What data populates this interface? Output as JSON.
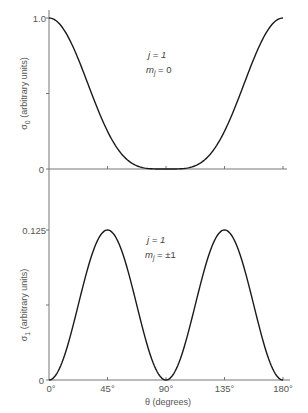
{
  "chart_data": [
    {
      "type": "line",
      "panel": "top",
      "ylabel": "σ0 (arbitrary units)",
      "ylabel_main": "σ",
      "ylabel_sub": "0",
      "ylabel_rest": " (arbitrary units)",
      "xlabel": "",
      "xlim": [
        0,
        180
      ],
      "ylim": [
        0,
        1.0
      ],
      "y_ticks": [
        0,
        0.5,
        1.0
      ],
      "y_tick_labels": [
        "0",
        "",
        "1.0"
      ],
      "x_ticks": [
        0,
        45,
        90,
        135,
        180
      ],
      "function": "cos^4(theta)",
      "annotation": {
        "line1": "j = 1",
        "line2_main": "m",
        "line2_sub": "j",
        "line2_rest": " = 0"
      },
      "series": [
        {
          "name": "j=1, mj=0",
          "x": [
            0,
            15,
            30,
            45,
            60,
            75,
            90,
            105,
            120,
            135,
            150,
            165,
            180
          ],
          "y": [
            1.0,
            0.871,
            0.5625,
            0.25,
            0.0625,
            0.0045,
            0.0,
            0.0045,
            0.0625,
            0.25,
            0.5625,
            0.871,
            1.0
          ]
        }
      ]
    },
    {
      "type": "line",
      "panel": "bottom",
      "ylabel": "σ1 (arbitrary units)",
      "ylabel_main": "σ",
      "ylabel_sub": "1",
      "ylabel_rest": " (arbitrary units)",
      "xlabel": "θ (degrees)",
      "xlim": [
        0,
        180
      ],
      "ylim": [
        0,
        0.125
      ],
      "y_ticks": [
        0,
        0.0625,
        0.125
      ],
      "y_tick_labels": [
        "0",
        "",
        "0.125"
      ],
      "x_ticks": [
        0,
        45,
        90,
        135,
        180
      ],
      "x_tick_labels": [
        "0°",
        "45°",
        "90°",
        "135°",
        "180°"
      ],
      "function": "(1/2) sin^2(theta) cos^2(theta)",
      "annotation": {
        "line1": "j = 1",
        "line2_main": "m",
        "line2_sub": "j",
        "line2_rest": " = ±1"
      },
      "series": [
        {
          "name": "j=1, mj=±1",
          "x": [
            0,
            15,
            30,
            45,
            60,
            75,
            90,
            105,
            120,
            135,
            150,
            165,
            180
          ],
          "y": [
            0.0,
            0.03125,
            0.09375,
            0.125,
            0.09375,
            0.03125,
            0.0,
            0.03125,
            0.09375,
            0.125,
            0.09375,
            0.03125,
            0.0
          ]
        }
      ]
    }
  ]
}
